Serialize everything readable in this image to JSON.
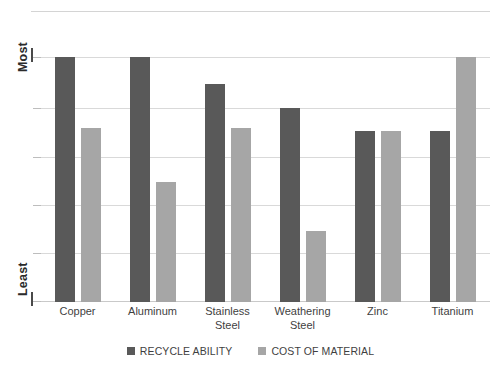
{
  "chart_data": {
    "type": "bar",
    "title": "",
    "xlabel": "",
    "ylabel": "",
    "grid": true,
    "legend_position": "bottom",
    "categories": [
      "Copper",
      "Aluminum",
      "Stainless\nSteel",
      "Weathering\nSteel",
      "Zinc",
      "Titanium"
    ],
    "y_tick_labels": [
      "Most",
      "Least"
    ],
    "y_axis_top_label": "Most",
    "y_axis_bottom_label": "Least",
    "ylim": [
      0,
      100
    ],
    "gridline_count": 6,
    "series": [
      {
        "name": "RECYCLE ABILITY",
        "color": "#595959",
        "values": [
          100,
          100,
          89,
          79,
          70,
          70
        ]
      },
      {
        "name": "COST OF MATERIAL",
        "color": "#a6a6a6",
        "values": [
          71,
          49,
          71,
          29,
          70,
          100
        ]
      }
    ]
  },
  "legend": {
    "items": [
      {
        "label": "RECYCLE ABILITY",
        "color": "#595959"
      },
      {
        "label": "COST OF MATERIAL",
        "color": "#a6a6a6"
      }
    ]
  },
  "colors": {
    "recycle": "#595959",
    "cost": "#a6a6a6",
    "gridline": "#d9d9d9",
    "text": "#3f3f3f",
    "background": "#ffffff"
  }
}
